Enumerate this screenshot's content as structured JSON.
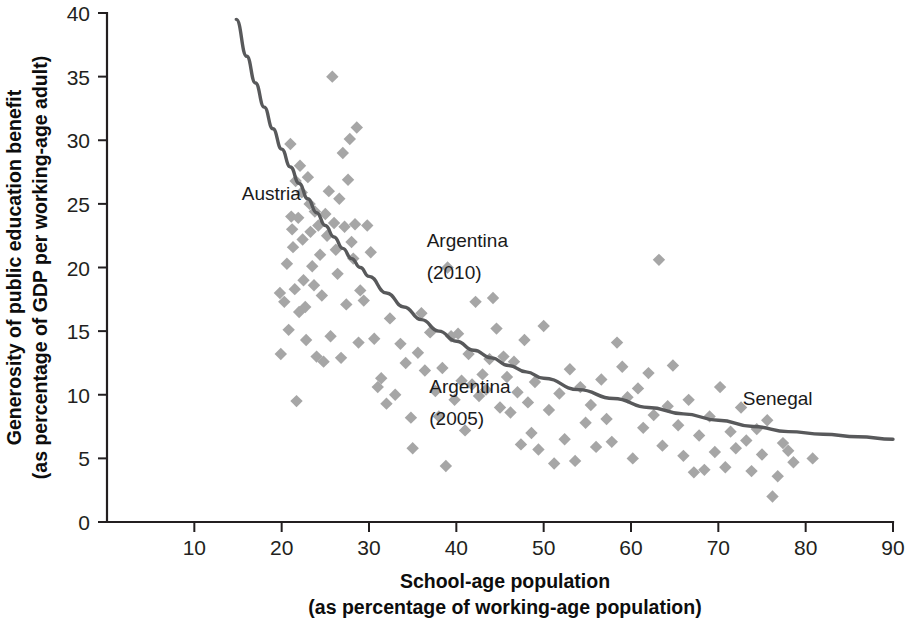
{
  "chart_data": {
    "type": "scatter",
    "title": "",
    "xlabel": "School-age population (as percentage of working-age population)",
    "ylabel": "Generosity of public education benefit (as percentage of GDP per working-age adult)",
    "xlabel_line1": "School-age population",
    "xlabel_line2": "(as percentage of working-age population)",
    "ylabel_line1": "Generosity of public education benefit",
    "ylabel_line2": "(as percentage of GDP per working-age adult)",
    "xlim": [
      0,
      90
    ],
    "ylim": [
      0,
      40
    ],
    "xticks": [
      10,
      20,
      30,
      40,
      50,
      60,
      70,
      80,
      90
    ],
    "yticks": [
      0,
      5,
      10,
      15,
      20,
      25,
      30,
      35,
      40
    ],
    "xtick_labels": [
      "10",
      "20",
      "30",
      "40",
      "50",
      "60",
      "70",
      "80",
      "90"
    ],
    "ytick_labels": [
      "0",
      "5",
      "10",
      "15",
      "20",
      "25",
      "30",
      "35",
      "40"
    ],
    "grid": false,
    "legend": "none",
    "marker_shape": "diamond",
    "marker_color": "#a6a6a6",
    "curve_color": "#58595b",
    "axis_color": "#231f20",
    "annotations": [
      {
        "label": "Austria",
        "x": 22.2,
        "y": 25.3,
        "anchor": "end"
      },
      {
        "label": "Argentina",
        "x": 36.6,
        "y": 21.6,
        "anchor": "start"
      },
      {
        "label": "(2010)",
        "x": 36.6,
        "y": 19.1,
        "anchor": "start"
      },
      {
        "label": "Argentina",
        "x": 36.9,
        "y": 10.1,
        "anchor": "start"
      },
      {
        "label": "(2005)",
        "x": 36.9,
        "y": 7.6,
        "anchor": "start"
      },
      {
        "label": "Senegal",
        "x": 72.8,
        "y": 9.2,
        "anchor": "start"
      }
    ],
    "trend_curve": {
      "form": "power",
      "description": "downward-sloping fitted curve from (14.8, 39.5) to (90, 6.5)",
      "points": [
        [
          14.8,
          39.5
        ],
        [
          16,
          36.6
        ],
        [
          17,
          34.5
        ],
        [
          18,
          32.6
        ],
        [
          19,
          30.9
        ],
        [
          20,
          29.3
        ],
        [
          21,
          27.9
        ],
        [
          22,
          26.6
        ],
        [
          23,
          25.4
        ],
        [
          24,
          24.3
        ],
        [
          25,
          23.3
        ],
        [
          26,
          22.4
        ],
        [
          27,
          21.5
        ],
        [
          28,
          20.7
        ],
        [
          29,
          20.0
        ],
        [
          30,
          19.3
        ],
        [
          32,
          18.0
        ],
        [
          34,
          16.9
        ],
        [
          36,
          15.9
        ],
        [
          38,
          15.0
        ],
        [
          40,
          14.2
        ],
        [
          42,
          13.5
        ],
        [
          44,
          12.9
        ],
        [
          46,
          12.3
        ],
        [
          48,
          11.8
        ],
        [
          50,
          11.3
        ],
        [
          54,
          10.4
        ],
        [
          58,
          9.7
        ],
        [
          62,
          9.0
        ],
        [
          66,
          8.5
        ],
        [
          70,
          8.0
        ],
        [
          74,
          7.5
        ],
        [
          78,
          7.1
        ],
        [
          82,
          6.9
        ],
        [
          86,
          6.7
        ],
        [
          90,
          6.5
        ]
      ]
    },
    "points": [
      [
        19.8,
        18.0
      ],
      [
        19.9,
        13.2
      ],
      [
        20.3,
        17.3
      ],
      [
        20.6,
        20.3
      ],
      [
        20.8,
        15.1
      ],
      [
        21.0,
        29.7
      ],
      [
        21.1,
        24.0
      ],
      [
        21.2,
        23.0
      ],
      [
        21.3,
        21.6
      ],
      [
        21.5,
        18.3
      ],
      [
        21.6,
        26.8
      ],
      [
        21.7,
        9.5
      ],
      [
        21.9,
        23.9
      ],
      [
        22.0,
        16.5
      ],
      [
        22.1,
        28.0
      ],
      [
        22.3,
        25.9
      ],
      [
        22.4,
        22.2
      ],
      [
        22.5,
        19.0
      ],
      [
        22.7,
        16.9
      ],
      [
        22.8,
        14.3
      ],
      [
        23.0,
        27.1
      ],
      [
        23.2,
        25.0
      ],
      [
        23.3,
        22.8
      ],
      [
        23.5,
        20.1
      ],
      [
        23.7,
        18.6
      ],
      [
        23.8,
        24.4
      ],
      [
        24.0,
        13.0
      ],
      [
        24.2,
        23.3
      ],
      [
        24.4,
        21.0
      ],
      [
        24.6,
        17.8
      ],
      [
        24.8,
        12.6
      ],
      [
        25.0,
        24.2
      ],
      [
        25.2,
        22.5
      ],
      [
        25.4,
        26.0
      ],
      [
        25.6,
        14.6
      ],
      [
        25.8,
        35.0
      ],
      [
        26.0,
        23.5
      ],
      [
        26.2,
        21.4
      ],
      [
        26.4,
        19.5
      ],
      [
        26.6,
        25.4
      ],
      [
        26.8,
        12.9
      ],
      [
        27.0,
        29.0
      ],
      [
        27.2,
        23.2
      ],
      [
        27.4,
        17.1
      ],
      [
        27.6,
        26.9
      ],
      [
        27.8,
        30.1
      ],
      [
        28.0,
        22.0
      ],
      [
        28.2,
        20.7
      ],
      [
        28.4,
        23.4
      ],
      [
        28.6,
        31.0
      ],
      [
        28.8,
        14.1
      ],
      [
        29.0,
        18.2
      ],
      [
        29.4,
        17.4
      ],
      [
        29.8,
        23.3
      ],
      [
        30.2,
        21.2
      ],
      [
        30.6,
        14.4
      ],
      [
        31.0,
        10.6
      ],
      [
        31.4,
        11.3
      ],
      [
        32.0,
        9.3
      ],
      [
        32.4,
        16.0
      ],
      [
        33.0,
        10.0
      ],
      [
        33.6,
        14.0
      ],
      [
        34.2,
        12.5
      ],
      [
        34.8,
        8.2
      ],
      [
        35.0,
        5.8
      ],
      [
        35.6,
        13.3
      ],
      [
        36.0,
        16.4
      ],
      [
        36.4,
        11.9
      ],
      [
        37.0,
        14.9
      ],
      [
        37.6,
        10.3
      ],
      [
        38.0,
        8.3
      ],
      [
        38.4,
        12.1
      ],
      [
        38.8,
        4.4
      ],
      [
        39.0,
        20.0
      ],
      [
        39.4,
        14.6
      ],
      [
        39.8,
        9.6
      ],
      [
        40.2,
        14.8
      ],
      [
        40.6,
        11.1
      ],
      [
        41.0,
        7.2
      ],
      [
        41.4,
        13.2
      ],
      [
        41.8,
        10.8
      ],
      [
        42.2,
        17.3
      ],
      [
        42.6,
        9.9
      ],
      [
        43.0,
        11.6
      ],
      [
        43.4,
        10.4
      ],
      [
        43.8,
        12.8
      ],
      [
        44.2,
        17.6
      ],
      [
        44.6,
        15.2
      ],
      [
        45.0,
        9.0
      ],
      [
        45.4,
        13.0
      ],
      [
        45.8,
        11.4
      ],
      [
        46.2,
        8.6
      ],
      [
        46.6,
        12.6
      ],
      [
        47.0,
        10.2
      ],
      [
        47.4,
        6.1
      ],
      [
        47.8,
        14.3
      ],
      [
        48.2,
        9.4
      ],
      [
        48.6,
        7.0
      ],
      [
        49.0,
        11.0
      ],
      [
        49.4,
        5.7
      ],
      [
        50.0,
        15.4
      ],
      [
        50.6,
        8.8
      ],
      [
        51.2,
        4.6
      ],
      [
        51.8,
        10.1
      ],
      [
        52.4,
        6.5
      ],
      [
        53.0,
        12.0
      ],
      [
        53.6,
        4.8
      ],
      [
        54.2,
        10.6
      ],
      [
        54.8,
        7.8
      ],
      [
        55.4,
        9.2
      ],
      [
        56.0,
        5.9
      ],
      [
        56.6,
        11.2
      ],
      [
        57.2,
        8.1
      ],
      [
        57.8,
        6.3
      ],
      [
        58.4,
        14.1
      ],
      [
        59.0,
        12.2
      ],
      [
        59.6,
        9.8
      ],
      [
        60.2,
        5.0
      ],
      [
        60.8,
        10.5
      ],
      [
        61.4,
        7.4
      ],
      [
        62.0,
        11.7
      ],
      [
        62.6,
        8.4
      ],
      [
        63.2,
        20.6
      ],
      [
        63.6,
        6.0
      ],
      [
        64.2,
        9.1
      ],
      [
        64.8,
        12.3
      ],
      [
        65.4,
        7.6
      ],
      [
        66.0,
        5.2
      ],
      [
        66.6,
        9.6
      ],
      [
        67.2,
        3.9
      ],
      [
        67.8,
        6.8
      ],
      [
        68.4,
        4.1
      ],
      [
        69.0,
        8.3
      ],
      [
        69.6,
        5.5
      ],
      [
        70.2,
        10.6
      ],
      [
        70.8,
        4.3
      ],
      [
        71.4,
        7.1
      ],
      [
        72.0,
        5.8
      ],
      [
        72.6,
        9.0
      ],
      [
        73.2,
        6.4
      ],
      [
        73.8,
        4.0
      ],
      [
        74.4,
        7.3
      ],
      [
        75.0,
        5.3
      ],
      [
        75.6,
        8.0
      ],
      [
        76.2,
        2.0
      ],
      [
        76.8,
        3.6
      ],
      [
        77.4,
        6.2
      ],
      [
        78.0,
        5.6
      ],
      [
        78.6,
        4.7
      ],
      [
        80.8,
        5.0
      ]
    ]
  }
}
